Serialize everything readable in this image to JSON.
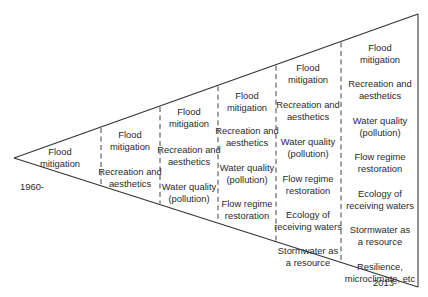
{
  "diagram": {
    "type": "funnel-timeline",
    "start_label": "1960-",
    "end_label": "2013-",
    "columns": [
      {
        "items": [
          [
            "Flood",
            "mitigation"
          ]
        ]
      },
      {
        "items": [
          [
            "Flood",
            "mitigation"
          ],
          [
            "Recreation and",
            "aesthetics"
          ]
        ]
      },
      {
        "items": [
          [
            "Flood",
            "mitigation"
          ],
          [
            "Recreation and",
            "aesthetics"
          ],
          [
            "Water quality",
            "(pollution)"
          ]
        ]
      },
      {
        "items": [
          [
            "Flood",
            "mitigation"
          ],
          [
            "Recreation and",
            "aesthetics"
          ],
          [
            "Water quality",
            "(pollution)"
          ],
          [
            "Flow regime",
            "restoration"
          ]
        ]
      },
      {
        "items": [
          [
            "Flood",
            "mitigation"
          ],
          [
            "Recreation and",
            "aesthetics"
          ],
          [
            "Water quality",
            "(pollution)"
          ],
          [
            "Flow regime",
            "restoration"
          ],
          [
            "Ecology of",
            "receiving waters"
          ],
          [
            "Stormwater as",
            "a resource"
          ]
        ]
      },
      {
        "items": [
          [
            "Flood",
            "mitigation"
          ],
          [
            "Recreation and",
            "aesthetics"
          ],
          [
            "Water quality",
            "(pollution)"
          ],
          [
            "Flow regime",
            "restoration"
          ],
          [
            "Ecology of",
            "receiving waters"
          ],
          [
            "Stormwater as",
            "a resource"
          ],
          [
            "Resilience,",
            "microclimate, etc"
          ]
        ]
      }
    ]
  }
}
